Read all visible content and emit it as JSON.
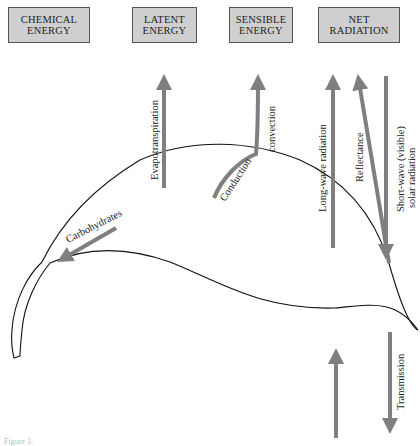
{
  "boxes": [
    {
      "id": "chemical",
      "line1": "CHEMICAL",
      "line2": "ENERGY"
    },
    {
      "id": "latent",
      "line1": "LATENT",
      "line2": "ENERGY"
    },
    {
      "id": "sensible",
      "line1": "SENSIBLE",
      "line2": "ENERGY"
    },
    {
      "id": "net",
      "line1": "NET",
      "line2": "RADIATION"
    }
  ],
  "labels": {
    "evapotranspiration": "Evapotranspiration",
    "convection": "convection",
    "conduction": "Conduction",
    "long_wave": "Long-wave radiation",
    "reflectance": "Reflectance",
    "short_wave_1": "Short-wave (visible)",
    "short_wave_2": "solar radiation",
    "carbohydrates": "Carbohydrates",
    "transmission": "Transmission"
  },
  "caption": "Figure 3.",
  "colors": {
    "box_fill": "#cfcfcf",
    "box_border": "#555555",
    "arrow": "#7f7f7f",
    "leaf_outline": "#111111"
  }
}
